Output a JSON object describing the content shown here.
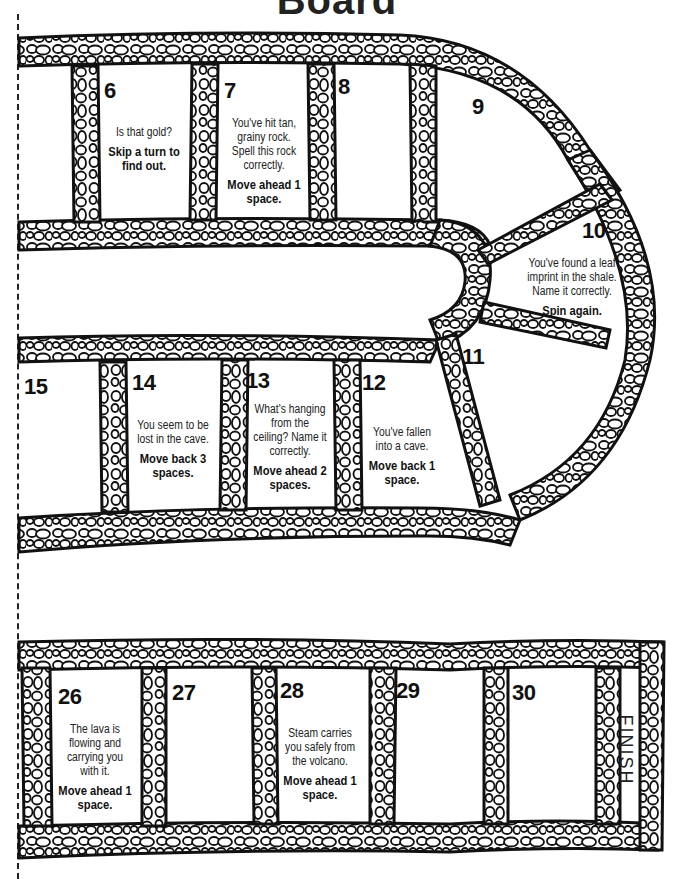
{
  "page": {
    "title": "Board",
    "cut_line": "dashed-cut-line"
  },
  "board": {
    "path_style": "cobblestone",
    "colors": {
      "stone_outline": "#111111",
      "stone_fill": "#ffffff",
      "background": "#ffffff"
    },
    "spaces": [
      {
        "number": "6",
        "message": "Is that gold?",
        "action": "Skip a turn to find out."
      },
      {
        "number": "7",
        "message": "You've hit tan, grainy rock. Spell this rock correctly.",
        "action": "Move ahead 1 space."
      },
      {
        "number": "8",
        "message": "",
        "action": ""
      },
      {
        "number": "9",
        "message": "",
        "action": ""
      },
      {
        "number": "10",
        "message": "You've found a leaf imprint in the shale. Name it correctly.",
        "action": "Spin again."
      },
      {
        "number": "11",
        "message": "",
        "action": ""
      },
      {
        "number": "12",
        "message": "You've fallen into a cave.",
        "action": "Move back 1 space."
      },
      {
        "number": "13",
        "message": "What's hanging from the ceiling? Name it correctly.",
        "action": "Move ahead 2 spaces."
      },
      {
        "number": "14",
        "message": "You seem to be lost in the cave.",
        "action": "Move back 3 spaces."
      },
      {
        "number": "15",
        "message": "",
        "action": ""
      },
      {
        "number": "26",
        "message": "The lava is flowing and carrying you with it.",
        "action": "Move ahead 1 space."
      },
      {
        "number": "27",
        "message": "",
        "action": ""
      },
      {
        "number": "28",
        "message": "Steam carries you safely from the volcano.",
        "action": "Move ahead 1 space."
      },
      {
        "number": "29",
        "message": "",
        "action": ""
      },
      {
        "number": "30",
        "message": "",
        "action": ""
      }
    ],
    "finish_label": "FINISH"
  }
}
